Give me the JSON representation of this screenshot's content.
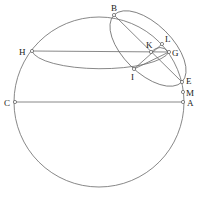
{
  "diagram": {
    "type": "geometric-construction",
    "circle": {
      "cx": 99,
      "cy": 102,
      "r": 85
    },
    "points": [
      {
        "id": "B",
        "label": "B",
        "x": 114,
        "y": 15,
        "lx": 111,
        "ly": 11
      },
      {
        "id": "L",
        "label": "L",
        "x": 162,
        "y": 44,
        "lx": 165,
        "ly": 42
      },
      {
        "id": "H",
        "label": "H",
        "x": 32,
        "y": 51,
        "lx": 19,
        "ly": 55
      },
      {
        "id": "K",
        "label": "K",
        "x": 151,
        "y": 52,
        "lx": 146,
        "ly": 48
      },
      {
        "id": "G",
        "label": "G",
        "x": 169,
        "y": 52,
        "lx": 172,
        "ly": 56
      },
      {
        "id": "I",
        "label": "I",
        "x": 134,
        "y": 69,
        "lx": 131,
        "ly": 80
      },
      {
        "id": "E",
        "label": "E",
        "x": 182,
        "y": 82,
        "lx": 186,
        "ly": 84
      },
      {
        "id": "M",
        "label": "M",
        "x": 183,
        "y": 92,
        "lx": 186,
        "ly": 96
      },
      {
        "id": "C",
        "label": "C",
        "x": 15,
        "y": 102,
        "lx": 4,
        "ly": 106
      },
      {
        "id": "A",
        "label": "A",
        "x": 183,
        "y": 102,
        "lx": 187,
        "ly": 106
      }
    ],
    "segments": [
      [
        "H",
        "G"
      ],
      [
        "C",
        "A"
      ],
      [
        "B",
        "E"
      ],
      [
        "I",
        "L"
      ],
      [
        "I",
        "G"
      ]
    ],
    "ellipses": [
      {
        "name": "tilted-ellipse",
        "cx": 148,
        "cy": 48.5,
        "rx": 47.7,
        "ry": 24.5,
        "rotate": 44.6
      },
      {
        "name": "horizontal-ellipse",
        "through": [
          "H",
          "I",
          "G"
        ]
      }
    ]
  }
}
